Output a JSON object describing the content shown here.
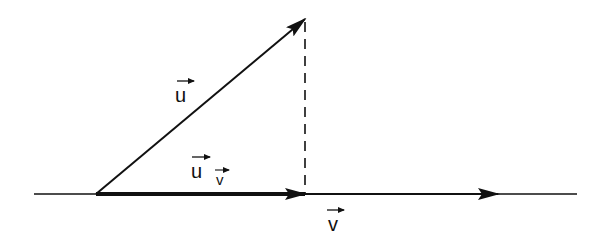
{
  "diagram": {
    "colors": {
      "stroke": "#111111",
      "background": "#ffffff"
    },
    "labels": {
      "u": {
        "text": "u",
        "arrow": true
      },
      "projection": {
        "text": "u",
        "subscript": "v",
        "arrow": true
      },
      "v": {
        "text": "v",
        "arrow": true
      }
    },
    "elements": [
      {
        "name": "vector-u",
        "from": [
          96,
          194
        ],
        "to": [
          305,
          19
        ],
        "style": "solid-arrow"
      },
      {
        "name": "projection-u-on-v",
        "from": [
          96,
          194
        ],
        "to": [
          305,
          194
        ],
        "style": "bold-arrow"
      },
      {
        "name": "vector-v",
        "from": [
          96,
          194
        ],
        "to": [
          497,
          194
        ],
        "style": "solid-arrow"
      },
      {
        "name": "baseline",
        "from": [
          34,
          194
        ],
        "to": [
          577,
          194
        ],
        "style": "line"
      },
      {
        "name": "perpendicular-drop",
        "from": [
          305,
          19
        ],
        "to": [
          305,
          194
        ],
        "style": "dashed"
      }
    ]
  }
}
